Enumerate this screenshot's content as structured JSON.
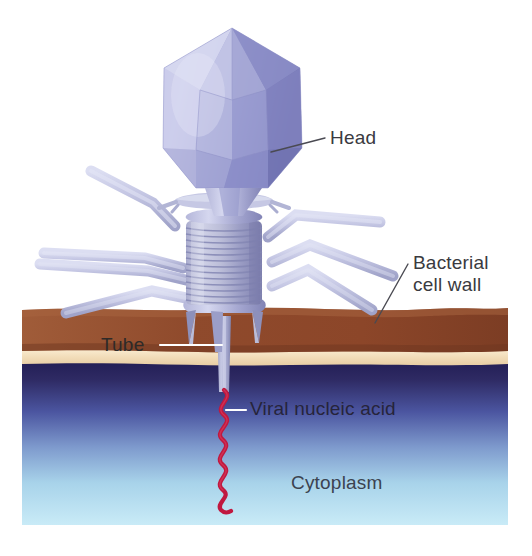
{
  "diagram": {
    "labels": {
      "head": "Head",
      "bacterial_cell_wall_line1": "Bacterial",
      "bacterial_cell_wall_line2": "cell wall",
      "tube": "Tube",
      "viral_nucleic_acid": "Viral nucleic acid",
      "cytoplasm": "Cytoplasm"
    },
    "parts": {
      "head": "icosahedral-capsid",
      "collar": "neck-collar",
      "sheath": "contractile-tail-sheath",
      "baseplate": "baseplate",
      "tail_fibers": "tail-fibers",
      "tube": "tail-tube",
      "nucleic_acid": "viral-dna-strand"
    },
    "colors": {
      "capsid_light": "#bfc0e4",
      "capsid_mid": "#9a9ccd",
      "capsid_dark": "#6f72ae",
      "capsid_highlight": "#d8dbf0",
      "fiber": "#c3c5e2",
      "fiber_shadow": "#9b9ec6",
      "sheath_light": "#cdcfe6",
      "sheath_dark": "#8d90bb",
      "cell_wall_brown": "#9a5334",
      "cell_wall_brown_dark": "#7e3f27",
      "membrane_cream": "#f1dcba",
      "cytoplasm_top": "#2b2560",
      "cytoplasm_mid": "#6f86bf",
      "cytoplasm_bottom": "#c5e8f5",
      "nucleic_acid_red": "#c0183f",
      "leader_dark": "#4a4a52",
      "leader_light": "#ffffff",
      "background": "#ffffff"
    },
    "structure": {
      "sheath_ring_count": 13,
      "tail_fiber_count": 7,
      "nucleic_acid_waves": 6
    }
  }
}
